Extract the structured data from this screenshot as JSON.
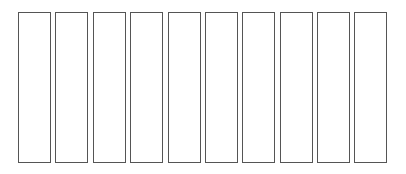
{
  "diagram": {
    "type": "row-of-empty-rectangles",
    "box_count": 10,
    "boxes": [
      {
        "index": 0,
        "label": ""
      },
      {
        "index": 1,
        "label": ""
      },
      {
        "index": 2,
        "label": ""
      },
      {
        "index": 3,
        "label": ""
      },
      {
        "index": 4,
        "label": ""
      },
      {
        "index": 5,
        "label": ""
      },
      {
        "index": 6,
        "label": ""
      },
      {
        "index": 7,
        "label": ""
      },
      {
        "index": 8,
        "label": ""
      },
      {
        "index": 9,
        "label": ""
      }
    ],
    "colors": {
      "border": "#555555",
      "fill": "#ffffff",
      "background": "#ffffff"
    }
  }
}
